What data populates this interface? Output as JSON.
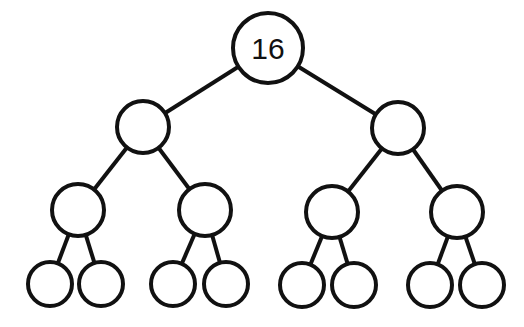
{
  "diagram": {
    "type": "binary-tree",
    "levels": 4,
    "root_label": "16",
    "colors": {
      "stroke": "#111111",
      "fill": "#ffffff",
      "background": "#ffffff"
    },
    "nodes": [
      {
        "id": "n0",
        "label": "16",
        "x": 268,
        "y": 48,
        "r": 35
      },
      {
        "id": "n1",
        "label": "",
        "x": 143,
        "y": 127,
        "r": 26
      },
      {
        "id": "n2",
        "label": "",
        "x": 398,
        "y": 128,
        "r": 26
      },
      {
        "id": "n3",
        "label": "",
        "x": 78,
        "y": 210,
        "r": 26
      },
      {
        "id": "n4",
        "label": "",
        "x": 205,
        "y": 210,
        "r": 26
      },
      {
        "id": "n5",
        "label": "",
        "x": 332,
        "y": 212,
        "r": 26
      },
      {
        "id": "n6",
        "label": "",
        "x": 457,
        "y": 212,
        "r": 26
      },
      {
        "id": "n7",
        "label": "",
        "x": 50,
        "y": 284,
        "r": 22
      },
      {
        "id": "n8",
        "label": "",
        "x": 101,
        "y": 284,
        "r": 22
      },
      {
        "id": "n9",
        "label": "",
        "x": 173,
        "y": 284,
        "r": 22
      },
      {
        "id": "n10",
        "label": "",
        "x": 226,
        "y": 284,
        "r": 22
      },
      {
        "id": "n11",
        "label": "",
        "x": 302,
        "y": 285,
        "r": 22
      },
      {
        "id": "n12",
        "label": "",
        "x": 354,
        "y": 285,
        "r": 22
      },
      {
        "id": "n13",
        "label": "",
        "x": 430,
        "y": 285,
        "r": 22
      },
      {
        "id": "n14",
        "label": "",
        "x": 482,
        "y": 285,
        "r": 22
      }
    ],
    "edges": [
      [
        "n0",
        "n1"
      ],
      [
        "n0",
        "n2"
      ],
      [
        "n1",
        "n3"
      ],
      [
        "n1",
        "n4"
      ],
      [
        "n2",
        "n5"
      ],
      [
        "n2",
        "n6"
      ],
      [
        "n3",
        "n7"
      ],
      [
        "n3",
        "n8"
      ],
      [
        "n4",
        "n9"
      ],
      [
        "n4",
        "n10"
      ],
      [
        "n5",
        "n11"
      ],
      [
        "n5",
        "n12"
      ],
      [
        "n6",
        "n13"
      ],
      [
        "n6",
        "n14"
      ]
    ]
  }
}
